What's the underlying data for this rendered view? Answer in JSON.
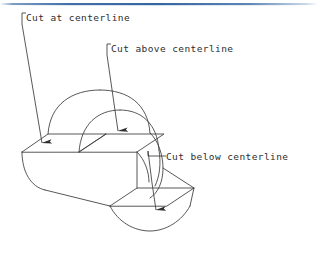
{
  "page": {
    "background_color": "#ffffff",
    "top_rule_color": "#3f6ea8",
    "line_color": "#3a3a3a",
    "text_color": "#2d2d2d"
  },
  "diagram": {
    "type": "isometric-technical-drawing",
    "callouts": [
      {
        "id": "cut-at-centerline",
        "label": "Cut at centerline",
        "label_x": 26,
        "label_y": 13,
        "hook_x": 22,
        "hook_y": 13,
        "leader_from_x": 22,
        "leader_from_y": 24,
        "leader_to_x": 43,
        "leader_to_y": 146,
        "arrow": "filled-triangle-down"
      },
      {
        "id": "cut-above-centerline",
        "label": "Cut above centerline",
        "label_x": 111,
        "label_y": 44,
        "hook_x": 107,
        "hook_y": 44,
        "leader_from_x": 107,
        "leader_from_y": 55,
        "leader_to_x": 119,
        "leader_to_y": 134,
        "arrow": "filled-triangle-down"
      },
      {
        "id": "cut-below-centerline",
        "label": "Cut below centerline",
        "label_x": 166,
        "label_y": 152,
        "hook_x": 162,
        "hook_y": 156,
        "leader_from_x": 148,
        "leader_from_y": 152,
        "leader_bend_x": 152,
        "leader_bend_y": 183,
        "leader_to_x": 157,
        "leader_to_y": 213,
        "arrow": "filled-triangle-down"
      }
    ],
    "labels": {
      "cut_at": "Cut at centerline",
      "cut_above": "Cut above centerline",
      "cut_below": "Cut below centerline"
    }
  }
}
